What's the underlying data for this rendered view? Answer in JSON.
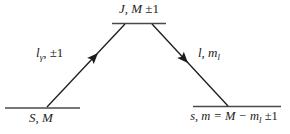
{
  "diagram": {
    "type": "energy-level-transition-diagram",
    "background": "#ffffff",
    "diagonal_line_color": "#1c1c1c",
    "level_line_color": "#4a4a4a",
    "levels": {
      "top": {
        "label_main": "J, M",
        "label_rest": " ±1"
      },
      "bottom_left": {
        "label": "S, M"
      },
      "bottom_right": {
        "label_pre": "s, m = M − m",
        "label_sub": "l",
        "label_post": " ±1"
      }
    },
    "arrows": {
      "left": {
        "base": "l",
        "sub": "γ",
        "rest": ", ±1",
        "direction": "up"
      },
      "right": {
        "pre": "l, m",
        "sub": "l",
        "direction": "down"
      }
    }
  }
}
